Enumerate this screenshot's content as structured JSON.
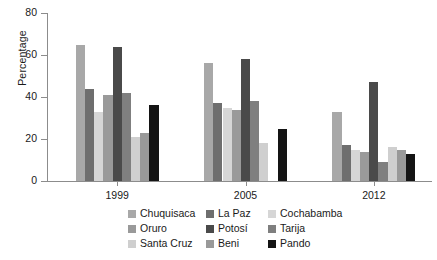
{
  "chart_data": {
    "type": "bar",
    "title": "",
    "subtitle": "",
    "xlabel": "",
    "ylabel": "Percentage",
    "categories": [
      "1999",
      "2005",
      "2012"
    ],
    "ylim": [
      0,
      80
    ],
    "yticks": [
      0,
      20,
      40,
      60,
      80
    ],
    "grid": false,
    "legend_position": "bottom",
    "series": [
      {
        "name": "Chuquisaca",
        "color": "#a8a8a8",
        "values": [
          65,
          56,
          33
        ]
      },
      {
        "name": "La Paz",
        "color": "#6e6e6e",
        "values": [
          44,
          37,
          17
        ]
      },
      {
        "name": "Cochabamba",
        "color": "#d6d6d6",
        "values": [
          33,
          35,
          15
        ]
      },
      {
        "name": "Oruro",
        "color": "#9a9a9a",
        "values": [
          41,
          34,
          14
        ]
      },
      {
        "name": "Potosí",
        "color": "#4a4a4a",
        "values": [
          64,
          58,
          47
        ]
      },
      {
        "name": "Tarija",
        "color": "#7f7f7f",
        "values": [
          42,
          38,
          9
        ]
      },
      {
        "name": "Santa Cruz",
        "color": "#cfcfcf",
        "values": [
          21,
          18,
          16
        ]
      },
      {
        "name": "Beni",
        "color": "#999999",
        "values": [
          23,
          0,
          15
        ]
      },
      {
        "name": "Pando",
        "color": "#141414",
        "values": [
          36,
          25,
          13
        ]
      }
    ]
  },
  "axis": {
    "y_tick_labels": [
      "0",
      "20",
      "40",
      "60",
      "80"
    ],
    "y_title": "Percentage",
    "x_tick_labels": [
      "1999",
      "2005",
      "2012"
    ]
  },
  "legend": {
    "items": [
      {
        "label": "Chuquisaca",
        "color": "#a8a8a8"
      },
      {
        "label": "La Paz",
        "color": "#6e6e6e"
      },
      {
        "label": "Cochabamba",
        "color": "#d6d6d6"
      },
      {
        "label": "Oruro",
        "color": "#9a9a9a"
      },
      {
        "label": "Potosí",
        "color": "#4a4a4a"
      },
      {
        "label": "Tarija",
        "color": "#7f7f7f"
      },
      {
        "label": "Santa Cruz",
        "color": "#cfcfcf"
      },
      {
        "label": "Beni",
        "color": "#999999"
      },
      {
        "label": "Pando",
        "color": "#141414"
      }
    ]
  }
}
